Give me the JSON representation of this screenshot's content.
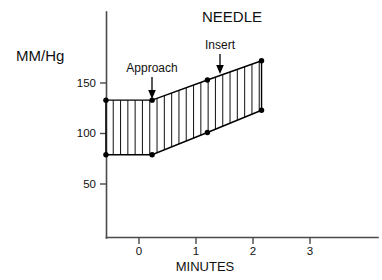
{
  "chart_data": {
    "type": "area",
    "title": "NEEDLE",
    "xlabel": "MINUTES",
    "ylabel": "MM/Hg",
    "grid": false,
    "legend": "none",
    "xlim": [
      -0.85,
      3.75
    ],
    "ylim": [
      0,
      185
    ],
    "xticks": [
      "0",
      "1",
      "2",
      "3"
    ],
    "xtick_values": [
      0,
      1,
      2,
      3
    ],
    "yticks": [
      "50",
      "100",
      "150"
    ],
    "ytick_values": [
      50,
      100,
      150
    ],
    "x": [
      -0.58,
      0.23,
      1.2,
      2.15
    ],
    "series": [
      {
        "name": "Systolic",
        "values": [
          133,
          133,
          153,
          172
        ]
      },
      {
        "name": "Diastolic",
        "values": [
          79,
          79,
          101,
          123
        ]
      }
    ],
    "fill": "vertical-hatch",
    "fill_color": "#000000",
    "annotations": [
      {
        "label": "Approach",
        "x": 0.23,
        "y": 133,
        "arrow": "down"
      },
      {
        "label": "Insert",
        "x": 1.55,
        "y": 160,
        "arrow": "down"
      }
    ]
  },
  "axis": {
    "title": "NEEDLE",
    "y_axis_label": "MM/Hg",
    "x_axis_label": "MINUTES",
    "y_tick_labels": [
      "150",
      "100",
      "50"
    ],
    "x_tick_labels": [
      "0",
      "1",
      "2",
      "3"
    ]
  },
  "annotations": {
    "approach": "Approach",
    "insert": "Insert"
  },
  "colors": {
    "ink": "#000000",
    "axis": "#4a4a4a",
    "background": "#ffffff"
  }
}
